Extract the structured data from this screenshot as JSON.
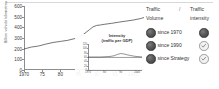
{
  "chart_data": [
    {
      "id": "main",
      "type": "line",
      "title": "",
      "xlabel": "",
      "ylabel": "Billion vehicle kilometres",
      "xlim": [
        1970,
        2003
      ],
      "ylim": [
        0,
        600
      ],
      "grid": false,
      "legend": "none",
      "xticks": [
        "1970",
        "75",
        "80",
        "85",
        "90",
        "95",
        "2000"
      ],
      "xtick_values": [
        1970,
        1975,
        1980,
        1985,
        1990,
        1995,
        2000
      ],
      "yticks": [
        "0",
        "100",
        "200",
        "300",
        "400",
        "500",
        "600"
      ],
      "ytick_values": [
        0,
        100,
        200,
        300,
        400,
        500,
        600
      ],
      "series": [
        {
          "name": "Traffic volume",
          "x": [
            1970,
            1972,
            1974,
            1976,
            1978,
            1980,
            1982,
            1984,
            1986,
            1988,
            1989,
            1990,
            1991,
            1992,
            1994,
            1996,
            1998,
            2000,
            2002,
            2003
          ],
          "values": [
            197,
            215,
            225,
            243,
            258,
            268,
            278,
            295,
            325,
            378,
            405,
            418,
            422,
            428,
            437,
            448,
            458,
            468,
            482,
            492
          ]
        }
      ]
    },
    {
      "id": "inset",
      "type": "line",
      "title": "Intensity\n(traffic per GDP)",
      "title_line1": "Intensity",
      "title_line2": "(traffic per GDP)",
      "xlabel": "",
      "ylabel": "",
      "xlim": [
        1970,
        2003
      ],
      "ylim": [
        0,
        120
      ],
      "grid": false,
      "legend": "none",
      "xticks": [
        "1970",
        "80",
        "90",
        "2000"
      ],
      "xtick_values": [
        1970,
        1980,
        1990,
        2000
      ],
      "yticks": [
        "120",
        "100",
        "80",
        "60",
        "40",
        "20",
        "0"
      ],
      "ytick_values": [
        120,
        100,
        80,
        60,
        40,
        20,
        0
      ],
      "series": [
        {
          "name": "Traffic intensity (traffic per GDP)",
          "x": [
            1970,
            1974,
            1978,
            1980,
            1982,
            1984,
            1986,
            1988,
            1990,
            1992,
            1994,
            1996,
            1998,
            2000,
            2002,
            2003
          ],
          "values": [
            60,
            60,
            60,
            61,
            62,
            63,
            66,
            72,
            76,
            74,
            70,
            67,
            64,
            62,
            61,
            60
          ]
        },
        {
          "name": "Baseline",
          "x": [
            1970,
            2003
          ],
          "values": [
            58,
            58
          ]
        }
      ]
    }
  ],
  "main_chart": {
    "y_axis_label": "Billion vehicle kilometres"
  },
  "inset_chart": {
    "title_line1": "Intensity",
    "title_line2": "(traffic per GDP)"
  },
  "legend": {
    "header": {
      "column_a_line1": "Traffic",
      "column_a_line2": "Volume",
      "separator": "/",
      "column_b_line1": "Traffic",
      "column_b_line2": "intensity"
    },
    "rows": [
      {
        "label": "since 1970",
        "volume_icon": "filled-dark-circle-icon",
        "intensity_icon": "filled-dark-circle-icon"
      },
      {
        "label": "since 1990",
        "volume_icon": "filled-dark-circle-icon",
        "intensity_icon": "check-circle-icon"
      },
      {
        "label": "since Strategy",
        "volume_icon": "filled-dark-circle-icon",
        "intensity_icon": "check-circle-icon"
      }
    ]
  },
  "colors": {
    "line": "#3a3a3a",
    "axis": "#8d8d8d",
    "text": "#2f2f2f",
    "indicator_dark": "#4a4a4a",
    "indicator_light": "#f2f2f2",
    "indicator_light_border": "#9b9b9b"
  }
}
